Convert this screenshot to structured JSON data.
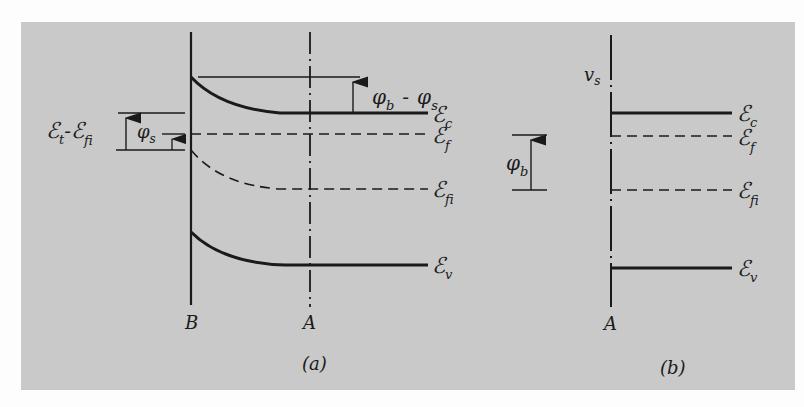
{
  "figure": {
    "panel_a": {
      "caption": "(a)",
      "boundary_labels": {
        "left": "B",
        "right": "A"
      },
      "bands": {
        "conduction": {
          "symbol": "ℰ",
          "sub": "c"
        },
        "fermi": {
          "symbol": "ℰ",
          "sub": "f"
        },
        "intrinsic": {
          "symbol": "ℰ",
          "sub": "fi"
        },
        "valence": {
          "symbol": "ℰ",
          "sub": "v"
        }
      },
      "annotations": {
        "barrier_diff": {
          "phi1": "φ",
          "sub1": "b",
          "minus": "-",
          "phi2": "φ",
          "sub2": "s"
        },
        "surface_potential": {
          "phi": "φ",
          "sub": "s"
        },
        "trap_level": {
          "e1": "ℰ",
          "sub1": "t",
          "minus": "-",
          "e2": "ℰ",
          "sub2": "fi"
        }
      }
    },
    "panel_b": {
      "caption": "(b)",
      "boundary_label": "A",
      "surface_label": {
        "v": "v",
        "sub": "s"
      },
      "barrier": {
        "phi": "φ",
        "sub": "b"
      },
      "bands": {
        "conduction": {
          "symbol": "ℰ",
          "sub": "c"
        },
        "fermi": {
          "symbol": "ℰ",
          "sub": "f"
        },
        "intrinsic": {
          "symbol": "ℰ",
          "sub": "fi"
        },
        "valence": {
          "symbol": "ℰ",
          "sub": "v"
        }
      }
    },
    "colors": {
      "panel": "#c9c9c9",
      "ink": "#1a1a1a",
      "background": "#fdfdfd"
    }
  }
}
